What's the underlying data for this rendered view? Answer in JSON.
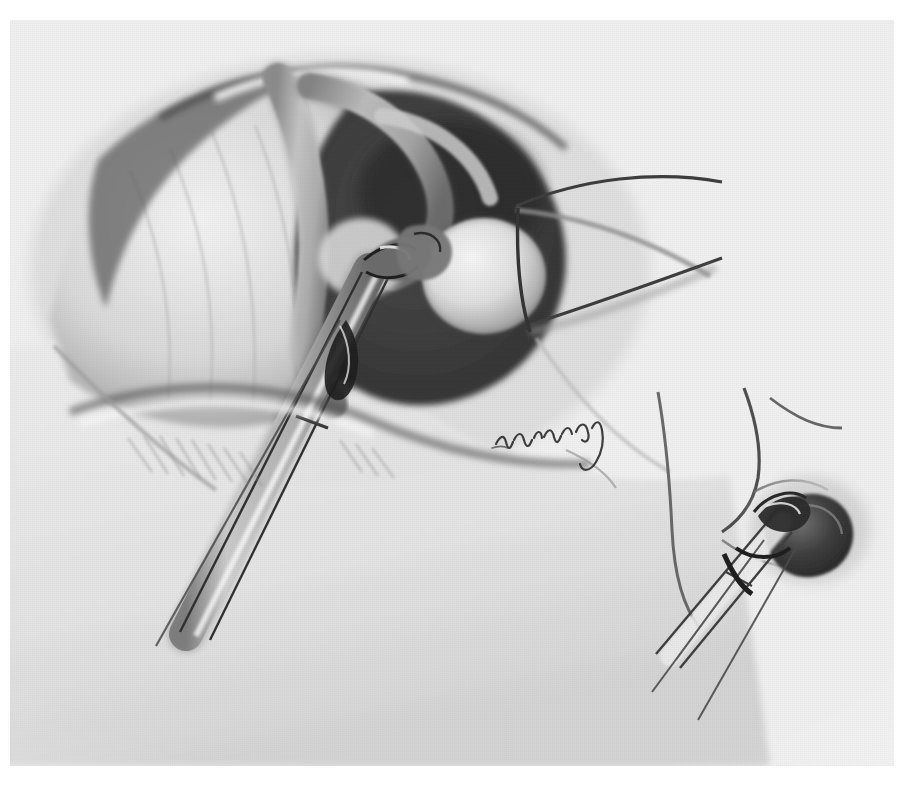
{
  "figure": {
    "kind": "medical-illustration",
    "medium": "graphite pencil drawing",
    "palette": "grayscale",
    "page_background": "#ffffff",
    "plate_background": "#f1f1f1",
    "ink_dark": "#2b2b2b",
    "ink_mid": "#6f6f6f",
    "ink_light": "#b9b9b9",
    "highlight": "#fafafa",
    "caption": "",
    "title": "",
    "labels": [],
    "signature": {
      "present": true,
      "legible": false,
      "transcription": "",
      "style": "handwritten cursive artist signature",
      "x": 494,
      "y": 432
    },
    "panels": [
      {
        "id": "main-view",
        "role": "primary surgical field",
        "position": "upper-left / center",
        "description": "Shaded anatomical cavity with curved tubular structures and a pale rounded body; an elongated instrument enters from the lower left and its jaws grasp tissue at the center.",
        "elements": [
          "tissue-mass-left",
          "tissue-fold-upper",
          "curved-tubular-structure",
          "dark-cavity",
          "pale-round-body",
          "instrument-shaft",
          "instrument-jaws",
          "grasped-tissue"
        ]
      },
      {
        "id": "inset-view",
        "role": "detail / close-up",
        "position": "lower-right",
        "description": "Line-drawn close-up of the instrument tip clamped onto a dark nodular mass, with two slender shaft outlines running to the lower left.",
        "elements": [
          "inset-outline-anatomy",
          "inset-instrument-shaft",
          "inset-instrument-jaws",
          "inset-dark-mass"
        ]
      }
    ]
  }
}
